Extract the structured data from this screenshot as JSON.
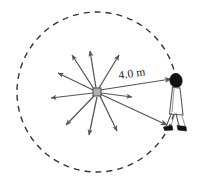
{
  "figure": {
    "type": "physics-diagram",
    "background_color": "#ffffff"
  },
  "labels": {
    "distance": "4.0 m"
  },
  "colors": {
    "stroke": "#555555",
    "dashed_circle": "#333333",
    "source_fill": "#b0b0b0",
    "source_stroke": "#4a4a4a",
    "person_outline": "#5a5a5a",
    "person_dark": "#111111",
    "text": "#1a1a1a"
  },
  "geometry": {
    "circle": {
      "center_x": 97,
      "center_y": 92,
      "radius": 80,
      "dash": "6 5",
      "stroke_width": 1.4
    },
    "source": {
      "x": 97,
      "y": 92,
      "size": 8
    },
    "person": {
      "head_x": 176,
      "head_y": 81,
      "feet_x": 171,
      "feet_y": 129
    },
    "radiating_arrows": [
      {
        "name": "arrow-up-left-far",
        "angle": 205,
        "length": 42
      },
      {
        "name": "arrow-up-left",
        "angle": 237,
        "length": 44
      },
      {
        "name": "arrow-up",
        "angle": 262,
        "length": 42
      },
      {
        "name": "arrow-up-right",
        "angle": 297,
        "length": 42
      },
      {
        "name": "arrow-right-short",
        "angle": 352,
        "length": 36
      },
      {
        "name": "arrow-left",
        "angle": 182,
        "length": 44
      },
      {
        "name": "arrow-down-left",
        "angle": 132,
        "length": 44
      },
      {
        "name": "arrow-down",
        "angle": 100,
        "length": 44
      },
      {
        "name": "arrow-down-right",
        "angle": 68,
        "length": 42
      }
    ],
    "listener_arrows": [
      {
        "name": "arrow-to-head",
        "x1": 99,
        "y1": 90,
        "x2": 172,
        "y2": 79
      },
      {
        "name": "arrow-to-feet",
        "x1": 99,
        "y1": 94,
        "x2": 168,
        "y2": 126
      }
    ]
  }
}
